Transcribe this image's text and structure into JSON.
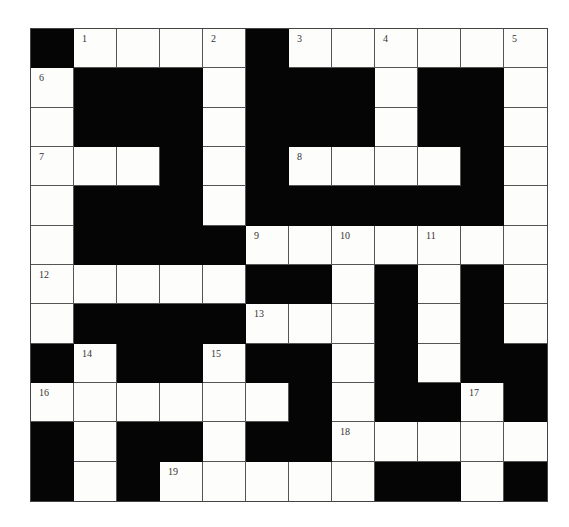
{
  "puzzle": {
    "rows": 12,
    "cols": 12,
    "colors": {
      "white_cell": "#fdfdfb",
      "black_cell": "#050505",
      "grid_line": "#555555",
      "number_text": "#333333"
    },
    "grid": [
      "#WWWW#WWWWWW",
      "W###W###W##W",
      "W###W###W##W",
      "WWW#W#WWWW#W",
      "W###W######W",
      "W####WWWWWWW",
      "WWWWW##W#W#W",
      "W####WWW#W#W",
      "#W##W##W#W##",
      "WWWWWW#W##W#",
      "#W##W##WWWWW",
      "#W#WWWWW##W#"
    ],
    "numbers": [
      {
        "row": 0,
        "col": 1,
        "label": "1"
      },
      {
        "row": 0,
        "col": 4,
        "label": "2"
      },
      {
        "row": 0,
        "col": 6,
        "label": "3"
      },
      {
        "row": 0,
        "col": 8,
        "label": "4"
      },
      {
        "row": 0,
        "col": 11,
        "label": "5"
      },
      {
        "row": 1,
        "col": 0,
        "label": "6"
      },
      {
        "row": 3,
        "col": 0,
        "label": "7"
      },
      {
        "row": 3,
        "col": 6,
        "label": "8"
      },
      {
        "row": 5,
        "col": 5,
        "label": "9"
      },
      {
        "row": 5,
        "col": 7,
        "label": "10"
      },
      {
        "row": 5,
        "col": 9,
        "label": "11"
      },
      {
        "row": 6,
        "col": 0,
        "label": "12"
      },
      {
        "row": 7,
        "col": 5,
        "label": "13"
      },
      {
        "row": 8,
        "col": 1,
        "label": "14"
      },
      {
        "row": 8,
        "col": 4,
        "label": "15"
      },
      {
        "row": 9,
        "col": 0,
        "label": "16"
      },
      {
        "row": 9,
        "col": 10,
        "label": "17"
      },
      {
        "row": 10,
        "col": 7,
        "label": "18"
      },
      {
        "row": 11,
        "col": 3,
        "label": "19"
      }
    ]
  }
}
